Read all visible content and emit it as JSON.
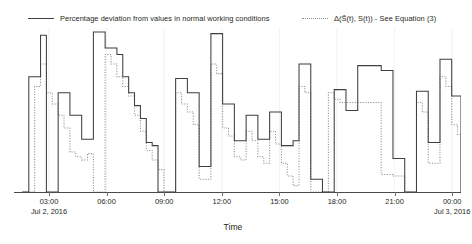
{
  "chart_data": {
    "type": "line",
    "subtype": "step",
    "title": "",
    "xlabel": "Time",
    "ylabel": "",
    "grid": {
      "vertical": true,
      "horizontal": false,
      "color": "#eeeeee"
    },
    "legend": {
      "position": "top",
      "entries": [
        {
          "label": "Percentage deviation from values in normal working conditions",
          "style": "solid",
          "color": "#3f3f3f"
        },
        {
          "label": "Δ(S̃(t), S(t)) - See Equation (3)",
          "style": "dotted",
          "color": "#8d8d8d"
        }
      ]
    },
    "xaxis": {
      "ticks": [
        {
          "time": "03:00",
          "date": "Jul 2, 2016",
          "pos": 0.1096
        },
        {
          "time": "06:00",
          "date": "",
          "pos": 0.2385
        },
        {
          "time": "09:00",
          "date": "",
          "pos": 0.3674
        },
        {
          "time": "12:00",
          "date": "",
          "pos": 0.4963
        },
        {
          "time": "15:00",
          "date": "",
          "pos": 0.6253
        },
        {
          "time": "18:00",
          "date": "",
          "pos": 0.7542
        },
        {
          "time": "21:00",
          "date": "",
          "pos": 0.8831
        },
        {
          "time": "00:00",
          "date": "Jul 3, 2016",
          "pos": 1.0
        },
        {
          "time": "03:00",
          "date": "",
          "pos": 1.0
        }
      ],
      "tick_positions_px": [
        49,
        107,
        164,
        222,
        280,
        337,
        395,
        452,
        510
      ],
      "range_start": "Jul 2, 2016 00:00",
      "range_end": "Jul 3, 2016 04:00"
    },
    "yaxis": {
      "visible": false,
      "ticks": [],
      "baseline": 0
    },
    "series": [
      {
        "name": "Percentage deviation from values in normal working conditions",
        "style": "solid",
        "color": "#3f3f3f",
        "x": [
          0.0185,
          0.0331,
          0.0462,
          0.0594,
          0.0725,
          0.0857,
          0.0988,
          0.1119,
          0.1251,
          0.1382,
          0.1514,
          0.1645,
          0.1776,
          0.1908,
          0.2039,
          0.2171,
          0.2302,
          0.2433,
          0.2565,
          0.2696,
          0.2828,
          0.2959,
          0.3091,
          0.3222,
          0.3353,
          0.3485,
          0.3616,
          0.3748,
          0.3879,
          0.401,
          0.4142,
          0.4273,
          0.4405,
          0.4536,
          0.4667,
          0.4799,
          0.493,
          0.5062,
          0.5193,
          0.5324,
          0.5456,
          0.5587,
          0.5719,
          0.585,
          0.5982,
          0.6113,
          0.6244,
          0.6376,
          0.6507,
          0.6639,
          0.677,
          0.6901,
          0.7033,
          0.7164,
          0.7296,
          0.7427,
          0.7558,
          0.769,
          0.7821,
          0.7953,
          0.8084,
          0.8215,
          0.8347,
          0.8478,
          0.861,
          0.8741,
          0.8873,
          0.9004,
          0.9135,
          0.9267,
          0.9398,
          0.953,
          0.9661,
          0.9792,
          0.9924,
          1.0
        ],
        "y": [
          0.0,
          0.72,
          0.72,
          0.98,
          0.0,
          0.0,
          0.62,
          0.62,
          0.48,
          0.48,
          0.33,
          0.33,
          1.0,
          1.0,
          0.9,
          0.9,
          0.86,
          0.72,
          0.62,
          0.54,
          0.46,
          0.31,
          0.29,
          0.0,
          0.0,
          0.0,
          0.71,
          0.71,
          0.62,
          0.62,
          0.16,
          0.16,
          0.99,
          0.99,
          0.55,
          0.55,
          0.32,
          0.32,
          0.48,
          0.48,
          0.33,
          0.33,
          0.5,
          0.5,
          0.29,
          0.29,
          0.32,
          0.8,
          0.8,
          0.08,
          0.08,
          0.0,
          0.0,
          0.64,
          0.64,
          0.51,
          0.51,
          0.79,
          0.79,
          0.79,
          0.79,
          0.76,
          0.76,
          0.21,
          0.21,
          0.0,
          0.0,
          0.63,
          0.63,
          0.31,
          0.31,
          0.83,
          0.83,
          0.6,
          0.6,
          0.22
        ],
        "step": "post"
      },
      {
        "name": "Δ(S̃(t), S(t)) - See Equation (3)",
        "style": "dotted",
        "color": "#8d8d8d",
        "x": [
          0.0185,
          0.0331,
          0.0462,
          0.0594,
          0.0725,
          0.0857,
          0.0988,
          0.1119,
          0.1251,
          0.1382,
          0.1514,
          0.1645,
          0.1776,
          0.1908,
          0.2039,
          0.2171,
          0.2302,
          0.2433,
          0.2565,
          0.2696,
          0.2828,
          0.2959,
          0.3091,
          0.3222,
          0.3353,
          0.3485,
          0.3616,
          0.3748,
          0.3879,
          0.401,
          0.4142,
          0.4273,
          0.4405,
          0.4536,
          0.4667,
          0.4799,
          0.493,
          0.5062,
          0.5193,
          0.5324,
          0.5456,
          0.5587,
          0.5719,
          0.585,
          0.5982,
          0.6113,
          0.6244,
          0.6376,
          0.6507,
          0.6639,
          0.677,
          0.6901,
          0.7033,
          0.7164,
          0.7296,
          0.7427,
          0.7558,
          0.769,
          0.7821,
          0.7953,
          0.8084,
          0.8215,
          0.8347,
          0.8478,
          0.861,
          0.8741,
          0.8873,
          0.9004,
          0.9135,
          0.9267,
          0.9398,
          0.953,
          0.9661,
          0.9792,
          0.9924,
          1.0
        ],
        "y": [
          0.0,
          0.0,
          0.66,
          0.8,
          0.62,
          0.55,
          0.48,
          0.4,
          0.25,
          0.22,
          0.2,
          0.24,
          0.0,
          0.0,
          0.86,
          0.8,
          0.72,
          0.66,
          0.6,
          0.48,
          0.38,
          0.26,
          0.2,
          0.14,
          0.0,
          0.0,
          0.62,
          0.55,
          0.5,
          0.42,
          0.08,
          0.08,
          0.8,
          0.74,
          0.4,
          0.35,
          0.22,
          0.2,
          0.38,
          0.32,
          0.22,
          0.18,
          0.38,
          0.3,
          0.18,
          0.1,
          0.04,
          0.66,
          0.62,
          0.0,
          0.0,
          0.0,
          0.62,
          0.58,
          0.56,
          0.56,
          0.56,
          0.56,
          0.56,
          0.56,
          0.56,
          0.11,
          0.11,
          0.1,
          0.1,
          0.0,
          0.0,
          0.56,
          0.5,
          0.18,
          0.18,
          0.72,
          0.66,
          0.42,
          0.36,
          0.1
        ],
        "step": "post"
      }
    ]
  },
  "axis_title": {
    "text": "Time"
  }
}
